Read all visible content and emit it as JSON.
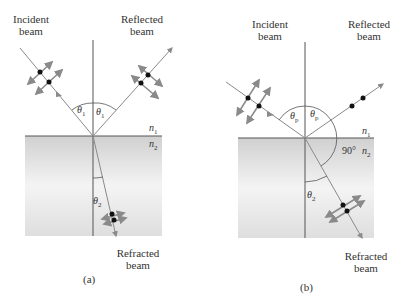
{
  "panels": [
    {
      "id": "a",
      "caption": "(a)",
      "incident_label_line1": "Incident",
      "incident_label_line2": "beam",
      "reflected_label_line1": "Reflected",
      "reflected_label_line2": "beam",
      "refracted_label_line1": "Refracted",
      "refracted_label_line2": "beam",
      "theta_incident": "θ",
      "theta_incident_sub": "1",
      "theta_reflected": "θ",
      "theta_reflected_sub": "1",
      "theta_refracted": "θ",
      "theta_refracted_sub": "2",
      "n1": "n",
      "n1_sub": "1",
      "n2": "n",
      "n2_sub": "2"
    },
    {
      "id": "b",
      "caption": "(b)",
      "incident_label_line1": "Incident",
      "incident_label_line2": "beam",
      "reflected_label_line1": "Reflected",
      "reflected_label_line2": "beam",
      "refracted_label_line1": "Refracted",
      "refracted_label_line2": "beam",
      "theta_incident": "θ",
      "theta_incident_sub": "p",
      "theta_reflected": "θ",
      "theta_reflected_sub": "p",
      "theta_refracted": "θ",
      "theta_refracted_sub": "2",
      "right_angle": "90°",
      "n1": "n",
      "n1_sub": "1",
      "n2": "n",
      "n2_sub": "2"
    }
  ],
  "colors": {
    "line": "#555555",
    "arrow": "#8a8a8a",
    "dot": "#111111",
    "medium_top": "#d4d4d4",
    "medium_mid": "#f2f2f2",
    "medium_bottom": "#e0e0e0"
  }
}
